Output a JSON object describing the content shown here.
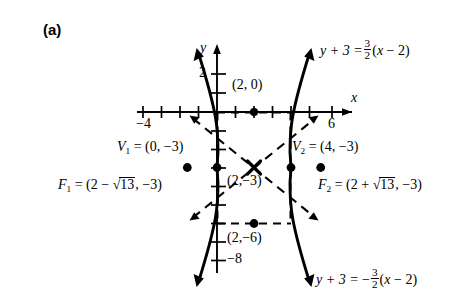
{
  "panel": {
    "label": "(a)"
  },
  "axes": {
    "x_name": "x",
    "y_name": "y",
    "x_ticks_labeled": [
      {
        "value": -4,
        "text": "−4"
      },
      {
        "value": 6,
        "text": "6"
      }
    ],
    "y_ticks_labeled": [
      {
        "value": 2,
        "text": "2"
      },
      {
        "value": -8,
        "text": "−8"
      }
    ],
    "x_range": [
      -5,
      7
    ],
    "y_range": [
      -9.5,
      3.2
    ],
    "origin_px": [
      217,
      112
    ],
    "unit_px": 18.5
  },
  "curve": {
    "type": "hyperbola",
    "orientation": "horizontal",
    "center": [
      2,
      -3
    ],
    "a": 2,
    "b": 3,
    "c_expression": "√13"
  },
  "points": [
    {
      "name": "center-x-marker",
      "label": "(2,−3)",
      "x": 2,
      "y": -3,
      "marker": "x"
    },
    {
      "name": "point-2-0",
      "label": "(2, 0)",
      "x": 2,
      "y": 0,
      "marker": "dot"
    },
    {
      "name": "point-2-minus6",
      "label": "(2,−6)",
      "x": 2,
      "y": -6,
      "marker": "dot"
    },
    {
      "name": "vertex-1",
      "x": 0,
      "y": -3,
      "marker": "dot"
    },
    {
      "name": "vertex-2",
      "x": 4,
      "y": -3,
      "marker": "dot"
    },
    {
      "name": "focus-1",
      "x": -1.606,
      "y": -3,
      "marker": "dot"
    },
    {
      "name": "focus-2",
      "x": 5.606,
      "y": -3,
      "marker": "dot"
    }
  ],
  "annotations": {
    "vertex1": {
      "name": "V",
      "sub": "1",
      "eq": "= (0, −3)"
    },
    "vertex2": {
      "name": "V",
      "sub": "2",
      "eq": "= (4, −3)"
    },
    "focus1": {
      "name": "F",
      "sub": "1",
      "pre": "= (2 − ",
      "radicand": "13",
      "post": ", −3)"
    },
    "focus2": {
      "name": "F",
      "sub": "2",
      "pre": "= (2 + ",
      "radicand": "13",
      "post": ", −3)"
    },
    "center_label": "(2,−3)",
    "point_2_0_label": "(2, 0)",
    "point_2_m6_label": "(2,−6)"
  },
  "asymptotes": [
    {
      "name": "asymptote-positive",
      "slope": 1.5,
      "lhs": "y + 3 =",
      "sign": "",
      "num": "3",
      "den": "2",
      "rhs_open": "(",
      "rhs_var": "x",
      "rhs_tail": "− 2)"
    },
    {
      "name": "asymptote-negative",
      "slope": -1.5,
      "lhs": "y + 3 =",
      "sign": "−",
      "num": "3",
      "den": "2",
      "rhs_open": "(",
      "rhs_var": "x",
      "rhs_tail": "− 2)"
    }
  ],
  "style": {
    "stroke": "#000000",
    "background": "#ffffff"
  }
}
